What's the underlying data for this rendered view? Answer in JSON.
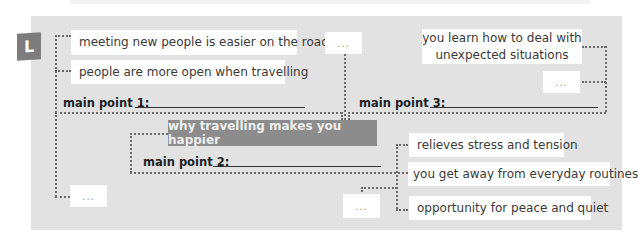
{
  "exercise": {
    "label": "L"
  },
  "diagram": {
    "title": "why travelling makes you happier",
    "main_points": [
      {
        "label": "main point 1:"
      },
      {
        "label": "main point 2:"
      },
      {
        "label": "main point 3:"
      }
    ],
    "point1_details": [
      "meeting new people is easier on the road",
      "people are more open when travelling",
      "..."
    ],
    "point2_details": [
      "relieves stress and tension",
      "you get away from everyday routines",
      "opportunity for peace and quiet",
      "..."
    ],
    "point3_details": [
      "you learn how to deal with",
      "unexpected situations",
      "...",
      "..."
    ]
  },
  "colors": {
    "panel": "#e2e2e2",
    "title_box": "#8c8c8c",
    "badge": "#7d7d7d",
    "note_box": "#ffffff"
  }
}
